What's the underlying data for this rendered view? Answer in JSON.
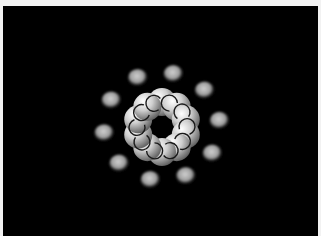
{
  "figure": {
    "description": "3D render of a ring of glowing spheres with curled connector lines, surrounded by outer blobs",
    "background_color": "#000000",
    "frame_color": "#f2f2f2",
    "ring": {
      "sphere_count": 10,
      "sphere_color": "#d8d8d8",
      "curl_color": "#1a1a1a"
    },
    "outer_blobs": {
      "count": 10,
      "color": "#bdbdbd"
    }
  }
}
